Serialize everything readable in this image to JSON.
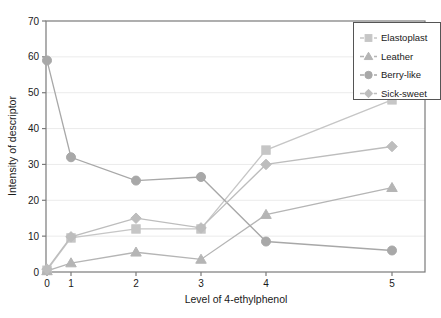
{
  "chart_data": {
    "type": "line",
    "title": "",
    "xlabel": "Level of 4-ethylphenol",
    "ylabel": "Intensity of descriptor",
    "x": [
      0,
      1,
      2,
      3,
      4,
      5
    ],
    "xticklabels": [
      "0",
      "1",
      "2",
      "3",
      "4",
      "5"
    ],
    "yticklabels": [
      "0",
      "10",
      "20",
      "30",
      "40",
      "50",
      "60",
      "70"
    ],
    "xlim": [
      0,
      5
    ],
    "ylim": [
      0,
      70
    ],
    "grid": "horizontal",
    "legend_position": "top-right",
    "series": [
      {
        "name": "Elastoplast",
        "marker": "square",
        "color": "#c6c6c6",
        "values": [
          0.5,
          9.5,
          12.0,
          12.0,
          34.0,
          48.0
        ]
      },
      {
        "name": "Leather",
        "marker": "triangle",
        "color": "#b5b5b5",
        "values": [
          0.3,
          2.5,
          5.5,
          3.5,
          16.0,
          23.5
        ]
      },
      {
        "name": "Berry-like",
        "marker": "circle",
        "color": "#a8a8a8",
        "values": [
          59.0,
          32.0,
          25.5,
          26.5,
          8.5,
          6.0
        ]
      },
      {
        "name": "Sick-sweet",
        "marker": "diamond",
        "color": "#bdbdbd",
        "values": [
          0.8,
          9.8,
          15.0,
          12.3,
          30.0,
          35.0
        ]
      }
    ]
  },
  "axes": {
    "y_title": "Intensity of descriptor",
    "x_title": "Level of 4-ethylphenol",
    "y_ticks": [
      "70",
      "60",
      "50",
      "40",
      "30",
      "20",
      "10",
      "0"
    ],
    "x_ticks": [
      "0",
      "1",
      "2",
      "3",
      "4",
      "5"
    ]
  },
  "legend": {
    "entries": [
      {
        "label": "Elastoplast"
      },
      {
        "label": "Leather"
      },
      {
        "label": "Berry-like"
      },
      {
        "label": "Sick-sweet"
      }
    ]
  },
  "colors": {
    "frame": "#7a7a7a",
    "grid": "#ebebeb",
    "text": "#1a1a1a",
    "elastoplast": "#c6c6c6",
    "leather": "#b5b5b5",
    "berry_like": "#a8a8a8",
    "sick_sweet": "#bdbdbd"
  }
}
